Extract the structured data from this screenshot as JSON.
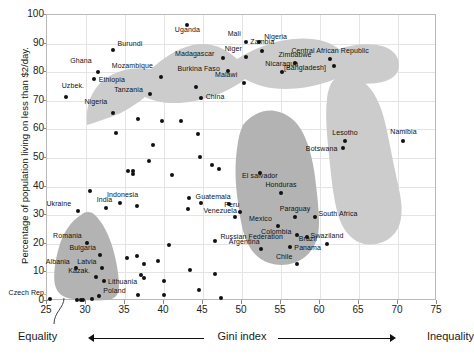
{
  "chart": {
    "type": "scatter",
    "title": "",
    "xlabel": "Gini index",
    "ylabel": "Percentage of population living on less than $2/day.",
    "xlim": [
      25,
      75
    ],
    "ylim": [
      0,
      100
    ],
    "xticks": [
      25,
      30,
      35,
      40,
      45,
      50,
      55,
      60,
      65,
      70,
      75
    ],
    "yticks": [
      0,
      10,
      20,
      30,
      40,
      50,
      60,
      70,
      80,
      90,
      100
    ],
    "grid": true,
    "legend_position": "none",
    "axis_annotations": {
      "left_end": "Equality",
      "right_end": "Inequality",
      "center": "Gini index"
    },
    "callout_note": "Slovenia, Croatia, Belarus",
    "shaded_clusters": [
      {
        "name": "africa-cluster",
        "color": "#cccccc"
      },
      {
        "name": "eastern-europe-cluster",
        "color": "#b0b0b0"
      },
      {
        "name": "latin-america-cluster",
        "color": "#b0b0b0"
      },
      {
        "name": "southern-africa-cluster",
        "color": "#cccccc"
      }
    ],
    "colors": {
      "point": "#111111",
      "blob_light": "#cccccc",
      "blob_dark": "#b3b3b3",
      "grid": "#e4e4e4",
      "frame": "#b9b9b9"
    }
  },
  "chart_data": {
    "type": "scatter",
    "title": "",
    "xlabel": "Gini index",
    "ylabel": "Percentage of population living on less than $2/day.",
    "xlim": [
      25,
      75
    ],
    "ylim": [
      0,
      100
    ],
    "grid": true,
    "legend_position": "none",
    "labeled_points": [
      {
        "label": "Uzbek.",
        "x": 27.4,
        "y": 71.5,
        "lx": -4,
        "ly": -11,
        "anchor": "start"
      },
      {
        "label": "Ghana",
        "x": 31.5,
        "y": 79.9,
        "lx": -4,
        "ly": -11,
        "anchor": "end"
      },
      {
        "label": "Ethiopia",
        "x": 31.0,
        "y": 77.6,
        "lx": 5,
        "ly": 1,
        "anchor": "start"
      },
      {
        "label": "Burundi",
        "x": 33.4,
        "y": 87.6,
        "lx": 5,
        "ly": -6,
        "anchor": "start"
      },
      {
        "label": "Nigeria",
        "x": 33.5,
        "y": 65.6,
        "lx": -4,
        "ly": -11,
        "anchor": "end"
      },
      {
        "label": "Mozambique",
        "x": 39.6,
        "y": 78.4,
        "lx": -6,
        "ly": -11,
        "anchor": "end"
      },
      {
        "label": "Tanzania",
        "x": 38.2,
        "y": 72.4,
        "lx": -5,
        "ly": -4,
        "anchor": "end"
      },
      {
        "label": "Uganda",
        "x": 43.0,
        "y": 96.5,
        "lx": 0,
        "ly": 5,
        "anchor": "middle"
      },
      {
        "label": "Madagascar",
        "x": 47.5,
        "y": 85.1,
        "lx": -6,
        "ly": -4,
        "anchor": "end"
      },
      {
        "label": "Burkina Faso",
        "x": 48.2,
        "y": 80.5,
        "lx": -6,
        "ly": -2,
        "anchor": "end"
      },
      {
        "label": "China",
        "x": 44.7,
        "y": 70.9,
        "lx": 5,
        "ly": -1,
        "anchor": "start"
      },
      {
        "label": "Malawi",
        "x": 50.3,
        "y": 76.1,
        "lx": -5,
        "ly": -8,
        "anchor": "end"
      },
      {
        "label": "Mali",
        "x": 50.5,
        "y": 90.6,
        "lx": -3,
        "ly": -8,
        "anchor": "end"
      },
      {
        "label": "Nigeria",
        "x": 52.2,
        "y": 90.5,
        "lx": 5,
        "ly": -5,
        "anchor": "start"
      },
      {
        "label": "Niger",
        "x": 50.5,
        "y": 85.3,
        "lx": -2,
        "ly": -8,
        "anchor": "end"
      },
      {
        "label": "Zambia",
        "x": 52.6,
        "y": 87.4,
        "lx": 0,
        "ly": -9,
        "anchor": "middle"
      },
      {
        "label": "Zimbabwe",
        "x": 56.8,
        "y": 83.2,
        "lx": 0,
        "ly": -8,
        "anchor": "middle"
      },
      {
        "label": "Nicaragua",
        "x": 55.1,
        "y": 79.9,
        "lx": 0,
        "ly": -8,
        "anchor": "middle"
      },
      {
        "label": "Central African Republic",
        "x": 61.3,
        "y": 84.5,
        "lx": 0,
        "ly": -8,
        "anchor": "middle"
      },
      {
        "label": "[Bangladesh]",
        "x": 61.8,
        "y": 82.2,
        "lx": -6,
        "ly": 2,
        "anchor": "end"
      },
      {
        "label": "Lesotho",
        "x": 63.2,
        "y": 56.1,
        "lx": 0,
        "ly": -8,
        "anchor": "middle"
      },
      {
        "label": "Botswana",
        "x": 63.0,
        "y": 53.5,
        "lx": -4,
        "ly": 1,
        "anchor": "end"
      },
      {
        "label": "Namibia",
        "x": 70.7,
        "y": 55.8,
        "lx": 0,
        "ly": -9,
        "anchor": "middle"
      },
      {
        "label": "El salvador",
        "x": 52.3,
        "y": 44.6,
        "lx": 0,
        "ly": 3,
        "anchor": "middle"
      },
      {
        "label": "Honduras",
        "x": 55.0,
        "y": 37.8,
        "lx": 0,
        "ly": -8,
        "anchor": "middle"
      },
      {
        "label": "Guatemala",
        "x": 48.3,
        "y": 33.8,
        "lx": 4,
        "ly": -7,
        "anchor": "end"
      },
      {
        "label": "Peru",
        "x": 49.8,
        "y": 31.2,
        "lx": 1,
        "ly": -7,
        "anchor": "end"
      },
      {
        "label": "Venezuela",
        "x": 49.1,
        "y": 29.2,
        "lx": 4,
        "ly": -6,
        "anchor": "end"
      },
      {
        "label": "Paraguay",
        "x": 56.8,
        "y": 29.5,
        "lx": 0,
        "ly": -8,
        "anchor": "middle"
      },
      {
        "label": "Mexico",
        "x": 54.6,
        "y": 26.3,
        "lx": -4,
        "ly": -7,
        "anchor": "end"
      },
      {
        "label": "Colombia",
        "x": 57.1,
        "y": 23.0,
        "lx": -4,
        "ly": -3,
        "anchor": "end"
      },
      {
        "label": "Brazil",
        "x": 58.3,
        "y": 22.4,
        "lx": 1,
        "ly": 2,
        "anchor": "middle"
      },
      {
        "label": "Argentina",
        "x": 52.4,
        "y": 18.2,
        "lx": 1,
        "ly": -7,
        "anchor": "end"
      },
      {
        "label": "Panama",
        "x": 56.2,
        "y": 18.9,
        "lx": 4,
        "ly": 1,
        "anchor": "start"
      },
      {
        "label": "Chile",
        "x": 57.1,
        "y": 13.0,
        "lx": -3,
        "ly": -7,
        "anchor": "end"
      },
      {
        "label": "South Africa",
        "x": 59.3,
        "y": 29.3,
        "lx": 4,
        "ly": -3,
        "anchor": "start"
      },
      {
        "label": "Swaziland",
        "x": 60.9,
        "y": 20.1,
        "lx": 0,
        "ly": -8,
        "anchor": "middle"
      },
      {
        "label": "Russian Federation",
        "x": 46.6,
        "y": 21.0,
        "lx": 5,
        "ly": -4,
        "anchor": "start"
      },
      {
        "label": "Ukraine",
        "x": 29.0,
        "y": 31.4,
        "lx": -5,
        "ly": -7,
        "anchor": "end"
      },
      {
        "label": "India",
        "x": 32.5,
        "y": 32.5,
        "lx": -1,
        "ly": -8,
        "anchor": "middle"
      },
      {
        "label": "Indonesia",
        "x": 34.3,
        "y": 34.4,
        "lx": 3,
        "ly": -8,
        "anchor": "middle"
      },
      {
        "label": "Romania",
        "x": 30.1,
        "y": 20.4,
        "lx": -3,
        "ly": -7,
        "anchor": "end"
      },
      {
        "label": "Bulgaria",
        "x": 31.8,
        "y": 16.0,
        "lx": -2,
        "ly": -7,
        "anchor": "end"
      },
      {
        "label": "Latvia",
        "x": 32.0,
        "y": 11.5,
        "lx": -3,
        "ly": -6,
        "anchor": "end"
      },
      {
        "label": "Albania",
        "x": 28.7,
        "y": 11.7,
        "lx": -4,
        "ly": -6,
        "anchor": "end"
      },
      {
        "label": "Kazak.",
        "x": 31.3,
        "y": 8.4,
        "lx": -4,
        "ly": -6,
        "anchor": "end"
      },
      {
        "label": "Lithuania",
        "x": 32.3,
        "y": 6.9,
        "lx": 4,
        "ly": 1,
        "anchor": "start"
      },
      {
        "label": "Poland",
        "x": 31.7,
        "y": 1.6,
        "lx": 4,
        "ly": -5,
        "anchor": "start"
      },
      {
        "label": "Czech Rep.",
        "x": 25.4,
        "y": 0.8,
        "lx": -2,
        "ly": -6,
        "anchor": "end"
      }
    ],
    "unlabeled_points": [
      {
        "x": 36.7,
        "y": 63.8
      },
      {
        "x": 39.8,
        "y": 63.0
      },
      {
        "x": 42.2,
        "y": 62.9
      },
      {
        "x": 33.9,
        "y": 58.7
      },
      {
        "x": 44.4,
        "y": 58.3
      },
      {
        "x": 38.6,
        "y": 54.4
      },
      {
        "x": 44.1,
        "y": 74.8
      },
      {
        "x": 38.1,
        "y": 49.1
      },
      {
        "x": 44.6,
        "y": 50.5
      },
      {
        "x": 46.2,
        "y": 47.6
      },
      {
        "x": 35.4,
        "y": 45.6
      },
      {
        "x": 36.0,
        "y": 45.3
      },
      {
        "x": 36.0,
        "y": 44.4
      },
      {
        "x": 41.0,
        "y": 44.0
      },
      {
        "x": 47.0,
        "y": 46.0
      },
      {
        "x": 36.6,
        "y": 33.3
      },
      {
        "x": 43.2,
        "y": 36.0
      },
      {
        "x": 44.8,
        "y": 34.2
      },
      {
        "x": 43.1,
        "y": 32.2
      },
      {
        "x": 35.2,
        "y": 15.0
      },
      {
        "x": 36.5,
        "y": 15.6
      },
      {
        "x": 37.4,
        "y": 13.1
      },
      {
        "x": 39.2,
        "y": 14.1
      },
      {
        "x": 40.6,
        "y": 19.7
      },
      {
        "x": 43.3,
        "y": 11.0
      },
      {
        "x": 37.0,
        "y": 9.0
      },
      {
        "x": 37.4,
        "y": 7.9
      },
      {
        "x": 40.0,
        "y": 6.9
      },
      {
        "x": 46.5,
        "y": 9.4
      },
      {
        "x": 44.5,
        "y": 4.0
      },
      {
        "x": 47.3,
        "y": 0.9
      },
      {
        "x": 29.3,
        "y": 0.4
      },
      {
        "x": 28.9,
        "y": 0.5
      },
      {
        "x": 29.6,
        "y": 0.5
      },
      {
        "x": 30.8,
        "y": 0.6
      },
      {
        "x": 36.7,
        "y": 2.2
      },
      {
        "x": 40.0,
        "y": 2.0
      },
      {
        "x": 30.5,
        "y": 38.5
      }
    ]
  }
}
